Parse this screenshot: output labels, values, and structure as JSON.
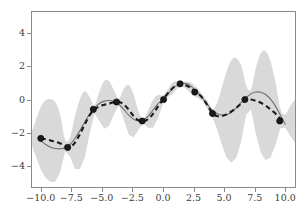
{
  "chart_data": {
    "type": "line",
    "title": "",
    "xlabel": "",
    "ylabel": "",
    "xlim": [
      -10.8,
      10.8
    ],
    "ylim": [
      -5.35,
      5.35
    ],
    "grid": false,
    "legend": "none",
    "xticks": [
      "-10.0",
      "-7.5",
      "-5.0",
      "-2.5",
      "0.0",
      "2.5",
      "5.0",
      "7.5",
      "10.0"
    ],
    "xtick_values": [
      -10.0,
      -7.5,
      -5.0,
      -2.5,
      0.0,
      2.5,
      5.0,
      7.5,
      10.0
    ],
    "yticks": [
      "4",
      "2",
      "0",
      "-2",
      "-4"
    ],
    "ytick_values": [
      4,
      2,
      0,
      -2,
      -4
    ],
    "colors": {
      "uncertainty_band": "#d9d9d9",
      "mean_line": "#6e6e6e",
      "prediction_line": "#1a1a1a",
      "observation_marker": "#1a1a1a",
      "axis": "#8a8a8a",
      "tick_label": "#3c3c3c",
      "background": "#ffffff"
    },
    "series": [
      {
        "name": "observations",
        "style": "scatter",
        "marker": "circle",
        "x": [
          -10.0,
          -7.8,
          -5.7,
          -3.8,
          -1.7,
          0.05,
          1.4,
          2.6,
          4.05,
          6.7,
          9.55
        ],
        "y": [
          -2.35,
          -2.9,
          -0.6,
          -0.15,
          -1.3,
          0.0,
          0.95,
          0.45,
          -0.85,
          0.0,
          -1.3
        ]
      },
      {
        "name": "true-function",
        "style": "solid",
        "x": [
          -10.0,
          -9.6,
          -9.2,
          -8.8,
          -8.4,
          -8.0,
          -7.6,
          -7.2,
          -6.8,
          -6.4,
          -6.0,
          -5.6,
          -5.2,
          -4.8,
          -4.4,
          -4.0,
          -3.6,
          -3.2,
          -2.8,
          -2.4,
          -2.0,
          -1.6,
          -1.2,
          -0.8,
          -0.4,
          0.0,
          0.4,
          0.8,
          1.2,
          1.6,
          2.0,
          2.4,
          2.8,
          3.2,
          3.6,
          4.0,
          4.4,
          4.8,
          5.2,
          5.6,
          6.0,
          6.4,
          6.8,
          7.2,
          7.6,
          8.0,
          8.4,
          8.8,
          9.2,
          9.6,
          10.0
        ],
        "y": [
          -2.5,
          -2.72,
          -2.88,
          -2.96,
          -2.98,
          -2.92,
          -2.72,
          -2.36,
          -1.88,
          -1.36,
          -0.88,
          -0.5,
          -0.24,
          -0.1,
          -0.06,
          -0.12,
          -0.3,
          -0.6,
          -0.95,
          -1.2,
          -1.3,
          -1.24,
          -1.0,
          -0.62,
          -0.25,
          0.02,
          0.34,
          0.66,
          0.9,
          0.98,
          0.95,
          0.72,
          0.44,
          0.1,
          -0.26,
          -0.62,
          -0.84,
          -0.94,
          -0.92,
          -0.78,
          -0.5,
          -0.18,
          0.12,
          0.34,
          0.45,
          0.44,
          0.3,
          0.02,
          -0.4,
          -0.95,
          -1.5
        ]
      },
      {
        "name": "predicted-mean",
        "style": "dashed",
        "x": [
          -10.0,
          -9.6,
          -9.2,
          -8.8,
          -8.4,
          -8.0,
          -7.6,
          -7.2,
          -6.8,
          -6.4,
          -6.0,
          -5.6,
          -5.2,
          -4.8,
          -4.4,
          -4.0,
          -3.6,
          -3.2,
          -2.8,
          -2.4,
          -2.0,
          -1.6,
          -1.2,
          -0.8,
          -0.4,
          0.0,
          0.4,
          0.8,
          1.2,
          1.6,
          2.0,
          2.4,
          2.8,
          3.2,
          3.6,
          4.0,
          4.4,
          4.8,
          5.2,
          5.6,
          6.0,
          6.4,
          6.8,
          7.2,
          7.6,
          8.0,
          8.4,
          8.8,
          9.2,
          9.6,
          10.0
        ],
        "y": [
          -2.35,
          -2.4,
          -2.48,
          -2.56,
          -2.66,
          -2.8,
          -2.88,
          -2.6,
          -2.1,
          -1.5,
          -0.95,
          -0.6,
          -0.42,
          -0.32,
          -0.24,
          -0.17,
          -0.15,
          -0.3,
          -0.62,
          -1.0,
          -1.26,
          -1.32,
          -1.18,
          -0.85,
          -0.42,
          0.0,
          0.38,
          0.7,
          0.9,
          0.92,
          0.82,
          0.62,
          0.4,
          0.12,
          -0.3,
          -0.8,
          -1.0,
          -1.0,
          -0.9,
          -0.72,
          -0.5,
          -0.25,
          -0.02,
          0.0,
          -0.08,
          -0.2,
          -0.38,
          -0.6,
          -0.85,
          -1.15,
          -1.3
        ]
      },
      {
        "name": "uncertainty-band-2sigma",
        "style": "fill-between",
        "x": [
          -10.8,
          -10.4,
          -10.0,
          -9.6,
          -9.2,
          -8.8,
          -8.4,
          -8.0,
          -7.6,
          -7.2,
          -6.8,
          -6.4,
          -6.0,
          -5.6,
          -5.2,
          -4.8,
          -4.4,
          -4.0,
          -3.6,
          -3.2,
          -2.8,
          -2.4,
          -2.0,
          -1.6,
          -1.2,
          -0.8,
          -0.4,
          0.0,
          0.4,
          0.8,
          1.2,
          1.6,
          2.0,
          2.4,
          2.8,
          3.2,
          3.6,
          4.0,
          4.4,
          4.8,
          5.2,
          5.6,
          6.0,
          6.4,
          6.8,
          7.2,
          7.6,
          8.0,
          8.4,
          8.8,
          9.2,
          9.6,
          10.0,
          10.4,
          10.8
        ],
        "sigma": [
          0.3,
          1.1,
          1.9,
          2.35,
          2.5,
          2.4,
          1.7,
          0.35,
          0.6,
          1.6,
          2.1,
          2.0,
          1.1,
          0.25,
          0.9,
          1.45,
          1.35,
          0.7,
          0.2,
          0.95,
          1.5,
          1.3,
          0.55,
          0.15,
          0.55,
          0.85,
          0.7,
          0.25,
          0.25,
          0.35,
          0.2,
          0.15,
          0.25,
          0.35,
          0.3,
          0.2,
          0.25,
          0.2,
          0.75,
          1.7,
          2.6,
          3.1,
          3.0,
          2.3,
          0.9,
          0.6,
          2.0,
          3.0,
          3.3,
          2.9,
          1.9,
          0.6,
          0.4,
          0.9,
          1.3
        ]
      }
    ]
  }
}
